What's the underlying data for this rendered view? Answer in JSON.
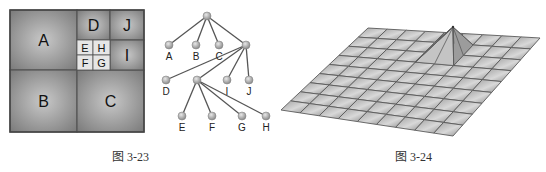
{
  "figures": [
    {
      "caption": "图 3-23",
      "quadtree": {
        "blocks": [
          {
            "label": "A",
            "x": 10,
            "y": 10,
            "w": 67,
            "h": 60
          },
          {
            "label": "B",
            "x": 10,
            "y": 70,
            "w": 67,
            "h": 62
          },
          {
            "label": "C",
            "x": 77,
            "y": 70,
            "w": 67,
            "h": 62
          },
          {
            "label": "D",
            "x": 77,
            "y": 10,
            "w": 33,
            "h": 30
          },
          {
            "label": "J",
            "x": 110,
            "y": 10,
            "w": 34,
            "h": 30
          },
          {
            "label": "I",
            "x": 110,
            "y": 40,
            "w": 34,
            "h": 30
          },
          {
            "label": "E",
            "x": 77,
            "y": 40,
            "w": 16,
            "h": 15
          },
          {
            "label": "H",
            "x": 93,
            "y": 40,
            "w": 17,
            "h": 15
          },
          {
            "label": "F",
            "x": 77,
            "y": 55,
            "w": 16,
            "h": 15
          },
          {
            "label": "G",
            "x": 93,
            "y": 55,
            "w": 17,
            "h": 15
          }
        ]
      },
      "tree": {
        "nodes": [
          {
            "id": "root",
            "label": "",
            "x": 207,
            "y": 16
          },
          {
            "id": "A",
            "label": "A",
            "x": 169,
            "y": 45
          },
          {
            "id": "B",
            "label": "B",
            "x": 196,
            "y": 45
          },
          {
            "id": "C",
            "label": "C",
            "x": 219,
            "y": 45
          },
          {
            "id": "X",
            "label": "",
            "x": 246,
            "y": 45
          },
          {
            "id": "D",
            "label": "D",
            "x": 166,
            "y": 80
          },
          {
            "id": "Y",
            "label": "",
            "x": 197,
            "y": 80
          },
          {
            "id": "I",
            "label": "I",
            "x": 227,
            "y": 80
          },
          {
            "id": "J",
            "label": "J",
            "x": 249,
            "y": 80
          },
          {
            "id": "E",
            "label": "E",
            "x": 182,
            "y": 116
          },
          {
            "id": "F",
            "label": "F",
            "x": 212,
            "y": 116
          },
          {
            "id": "G",
            "label": "G",
            "x": 242,
            "y": 116
          },
          {
            "id": "H",
            "label": "H",
            "x": 266,
            "y": 116
          }
        ],
        "edges": [
          [
            "root",
            "A"
          ],
          [
            "root",
            "B"
          ],
          [
            "root",
            "C"
          ],
          [
            "root",
            "X"
          ],
          [
            "X",
            "D"
          ],
          [
            "X",
            "Y"
          ],
          [
            "X",
            "I"
          ],
          [
            "X",
            "J"
          ],
          [
            "Y",
            "E"
          ],
          [
            "Y",
            "F"
          ],
          [
            "Y",
            "G"
          ],
          [
            "Y",
            "H"
          ]
        ]
      }
    },
    {
      "caption": "图 3-24",
      "mesh": {
        "grid": 9,
        "corners": {
          "back_left": [
            368,
            28
          ],
          "back_right": [
            540,
            38
          ],
          "front_right": [
            453,
            136
          ],
          "front_left": [
            281,
            110
          ]
        },
        "peak": {
          "apex": [
            453,
            27
          ],
          "cell_u": 5,
          "cell_v": 2
        }
      }
    }
  ],
  "colors": {
    "block_dark": "#7a7a7a",
    "block_light": "#c8c8c8",
    "small_block": "#e6e6e6",
    "border": "#555555",
    "node_fill": "#b4b4b4",
    "edge": "#555555",
    "mesh_line": "#5a5a5a"
  }
}
